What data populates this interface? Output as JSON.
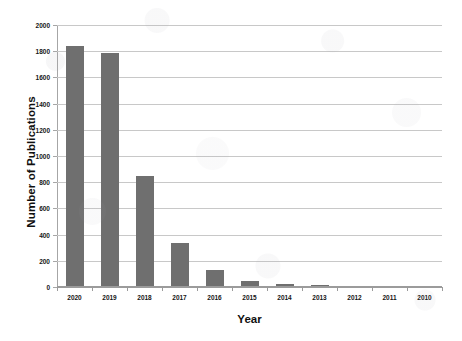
{
  "chart_data": {
    "type": "bar",
    "title": "",
    "xlabel": "Year",
    "ylabel": "Number of Publications",
    "categories": [
      "2020",
      "2019",
      "2018",
      "2017",
      "2016",
      "2015",
      "2014",
      "2013",
      "2012",
      "2011",
      "2010"
    ],
    "values": [
      1835,
      1775,
      843,
      330,
      120,
      35,
      18,
      4,
      0,
      0,
      0
    ],
    "ylim": [
      0,
      2000
    ],
    "yticks": [
      0,
      200,
      400,
      600,
      800,
      1000,
      1200,
      1400,
      1600,
      1800,
      2000
    ],
    "ytick_labels": [
      "0",
      "200",
      "400",
      "600",
      "800",
      "1000",
      "1200",
      "1400",
      "1600",
      "1800",
      "2000"
    ],
    "grid": true,
    "legend": false,
    "series": [
      {
        "name": "Number of Publications",
        "color": "#6F6F6F",
        "values": [
          1835,
          1775,
          843,
          330,
          120,
          35,
          18,
          4,
          0,
          0,
          0
        ]
      }
    ],
    "colors": {
      "bar": "#6F6F6F",
      "gridline": "#C8C8C8",
      "axis": "#A6A6A6",
      "text": "#151515",
      "background": "#FFFFFF"
    }
  }
}
